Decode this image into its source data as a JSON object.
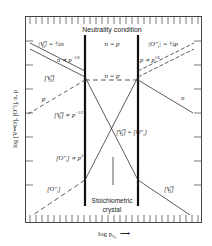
{
  "diagram": {
    "type": "brouwer-defect-diagram",
    "title_top": "Neutrality condition",
    "region_label_bottom_1": "Stoichiometric",
    "region_label_bottom_2": "crystal",
    "x_axis_label": "log p",
    "x_axis_sub": "O₂",
    "x_axis_arrow": "⟶",
    "y_axis_label": "log [V••O], [O″i], n, p",
    "regions": [
      {
        "name": "left",
        "condition": "[V••O] = ½n"
      },
      {
        "name": "middle",
        "condition": "n = p"
      },
      {
        "name": "right",
        "condition": "[O″i] = ½p"
      }
    ],
    "labels": {
      "vo_half_n_a": "|V",
      "vo_half_n_b": "| = ½n",
      "n_eq_p_top": "n = p",
      "oi_half_p_a": "|O″",
      "oi_half_p_b": "| = ½p",
      "n_prop": "n ∝ p",
      "n_prop_sup": "−1/6",
      "p_prop": "p ∝ p",
      "p_prop_sup": "1/6",
      "vo_left": "[V",
      "n_eq_p_mid": "n = p",
      "p_label": "p",
      "n_label": "n",
      "vo_prop": "[V",
      "vo_prop_tail": "] ∝ p",
      "vo_prop_sup": "−1/2",
      "vo_eq_oi": "[V",
      "vo_eq_oi_tail": "] = [O″",
      "vo_eq_oi_end": "]",
      "oi_prop": "[O″",
      "oi_prop_tail": "] ∝ p",
      "oi_prop_sup": "1/2",
      "oi_left": "[O″",
      "vo_right": "[V",
      "o2_sub": "O₂",
      "vo_sup": "••",
      "vo_sub": "O",
      "i_sub": "i"
    }
  }
}
